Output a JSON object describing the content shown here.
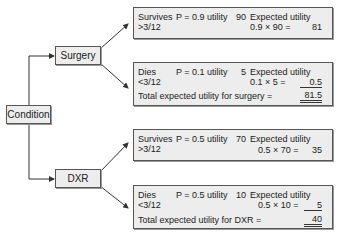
{
  "root": {
    "label": "Condition"
  },
  "branches": [
    {
      "label": "Surgery",
      "outcomes": [
        {
          "outcome": "Survives",
          "period": ">3/12",
          "prob_text": "P = 0.9 utility",
          "utility": "90",
          "eu_label": "Expected utility",
          "calc": "0.9 × 90 =",
          "value": "81"
        },
        {
          "outcome": "Dies",
          "period": "<3/12",
          "prob_text": "P = 0.1 utility",
          "utility": "5",
          "eu_label": "Expected utility",
          "calc": "0.1 × 5 =",
          "value": "0.5",
          "total_label": "Total expected utility for surgery =",
          "total": "81.5"
        }
      ]
    },
    {
      "label": "DXR",
      "outcomes": [
        {
          "outcome": "Survives",
          "period": ">3/12",
          "prob_text": "P = 0.5 utility",
          "utility": "70",
          "eu_label": "Expected utility",
          "calc": "0.5 × 70 =",
          "value": "35"
        },
        {
          "outcome": "Dies",
          "period": "<3/12",
          "prob_text": "P = 0.5 utility",
          "utility": "10",
          "eu_label": "Expected utility",
          "calc": "0.5 × 10 =",
          "value": "5",
          "total_label": "Total expected utility for DXR =",
          "total": "40"
        }
      ]
    }
  ]
}
